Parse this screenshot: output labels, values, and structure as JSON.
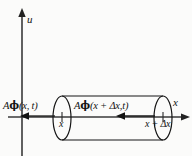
{
  "figure": {
    "background_color": "#fbfbfa",
    "ink_color": "#141414",
    "axes": {
      "vertical_label": "u",
      "horizontal_label": "x",
      "vertical_axis_name": "u-axis",
      "horizontal_axis_name": "x-axis"
    },
    "labels": {
      "flux_left": "Aϕ(x, t)",
      "flux_left_parts": {
        "pre": "A",
        "phi": "ϕ",
        "post": "(x, t)"
      },
      "flux_right": "Aϕ(x + Δx,t)",
      "flux_right_parts": {
        "pre": "A",
        "phi": "ϕ",
        "post": "(x + Δx,t)"
      },
      "tick_left": "x",
      "tick_right": "x + Δx"
    },
    "geometry": {
      "axis_y": 117,
      "vaxis_x": 22,
      "cylinder_left_x": 62,
      "cylinder_right_x": 163,
      "cylinder_top_y": 97,
      "cylinder_bottom_y": 141,
      "ellipse_rx": 9,
      "ellipse_ry": 22
    },
    "arrows": {
      "u_axis_arrow": "up-arrow",
      "x_axis_arrow": "right-arrow",
      "outflow_arrow": "left-arrow",
      "inflow_arrow": "left-arrow"
    }
  }
}
